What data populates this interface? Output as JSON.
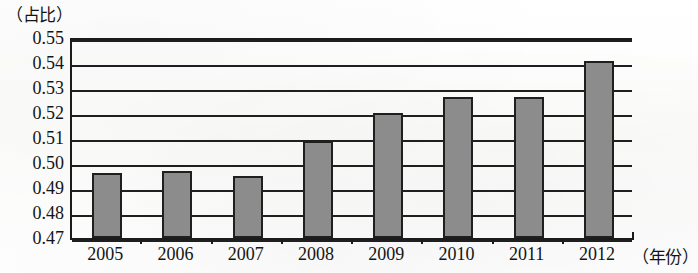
{
  "chart_data": {
    "type": "bar",
    "title": "",
    "subtitle": "",
    "xlabel": "（年份）",
    "ylabel": "（占比）",
    "categories": [
      "2005",
      "2006",
      "2007",
      "2008",
      "2009",
      "2010",
      "2011",
      "2012"
    ],
    "values": [
      0.496,
      0.497,
      0.495,
      0.509,
      0.52,
      0.5265,
      0.5265,
      0.541
    ],
    "series": [
      {
        "name": "占比",
        "values": [
          0.496,
          0.497,
          0.495,
          0.509,
          0.52,
          0.5265,
          0.5265,
          0.541
        ]
      }
    ],
    "ylim": [
      0.47,
      0.55
    ],
    "ytick_step": 0.01,
    "ytick_labels": [
      "0.55",
      "0.54",
      "0.53",
      "0.52",
      "0.51",
      "0.50",
      "0.49",
      "0.48",
      "0.47"
    ],
    "ytick_values": [
      0.55,
      0.54,
      0.53,
      0.52,
      0.51,
      0.5,
      0.49,
      0.48,
      0.47
    ],
    "xtick_labels": [
      "2005",
      "2006",
      "2007",
      "2008",
      "2009",
      "2010",
      "2011",
      "2012"
    ],
    "grid": true,
    "grid_orientation": "horizontal",
    "legend": false,
    "legend_position": "none",
    "bar_color": "#8c8c8c",
    "bar_edge_color": "#1f1f1f",
    "axis_color": "#1b1b1b",
    "background_color": "#fdfdfc",
    "annotations": []
  }
}
